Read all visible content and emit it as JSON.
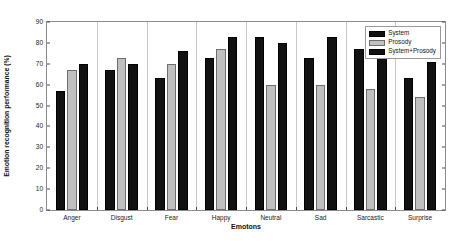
{
  "chart_data": {
    "type": "bar",
    "title": "",
    "xlabel": "Emotons",
    "ylabel": "Emotion recognition performance (%)",
    "categories": [
      "Anger",
      "Disgust",
      "Fear",
      "Happy",
      "Neutral",
      "Sad",
      "Sarcastic",
      "Surprise"
    ],
    "series": [
      {
        "name": "System",
        "color": "#111111",
        "values": [
          57,
          67,
          63,
          73,
          83,
          73,
          77,
          63
        ]
      },
      {
        "name": "Prosody",
        "color": "#c0c0c0",
        "values": [
          67,
          73,
          70,
          77,
          60,
          60,
          58,
          54
        ]
      },
      {
        "name": "System+Prosody",
        "color": "#111111",
        "values": [
          70,
          70,
          76,
          83,
          80,
          83,
          83,
          71
        ]
      }
    ],
    "ylim": [
      0,
      90
    ],
    "yticks": [
      0,
      10,
      20,
      30,
      40,
      50,
      60,
      70,
      80,
      90
    ],
    "ytick_labels": [
      "0",
      "10",
      "20",
      "30",
      "40",
      "50",
      "60",
      "70",
      "80",
      "90"
    ],
    "grid": "vertical-group-separators",
    "legend_position": "top-right",
    "legend_entries": [
      "System",
      "Prosody",
      "System+Prosody"
    ]
  }
}
